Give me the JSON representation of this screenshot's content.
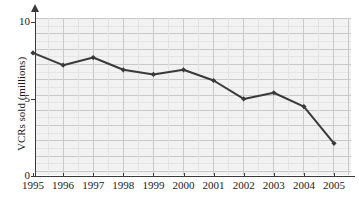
{
  "chart_data": {
    "type": "line",
    "title": "",
    "xlabel": "",
    "ylabel": "VCRs sold (millions)",
    "categories": [
      "1995",
      "1996",
      "1997",
      "1998",
      "1999",
      "2000",
      "2001",
      "2002",
      "2003",
      "2004",
      "2005"
    ],
    "values": [
      8.0,
      7.2,
      7.7,
      6.9,
      6.6,
      6.9,
      6.2,
      5.0,
      5.4,
      4.5,
      2.1
    ],
    "x_tick_labels": [
      "1995",
      "1996",
      "1997",
      "1998",
      "1999",
      "2000",
      "2001",
      "2002",
      "2003",
      "2004",
      "2005"
    ],
    "y_tick_labels": [
      "0",
      "5",
      "10"
    ],
    "y_tick_values": [
      0,
      5,
      10
    ],
    "ylim": [
      0,
      11
    ],
    "xlim": [
      "1995",
      "2005"
    ],
    "grid": true,
    "grid_major_color": "#c9c9c9",
    "grid_minor_color": "#e3e3e3",
    "plot_background": "#f2f2f2",
    "line_color": "#3a3a3a",
    "marker": "diamond",
    "legend": null,
    "legend_position": "none",
    "series": [
      {
        "name": "VCRs sold (millions)",
        "points": [
          {
            "x": "1995",
            "y": 8.0
          },
          {
            "x": "1996",
            "y": 7.2
          },
          {
            "x": "1997",
            "y": 7.7
          },
          {
            "x": "1998",
            "y": 6.9
          },
          {
            "x": "1999",
            "y": 6.6
          },
          {
            "x": "2000",
            "y": 6.9
          },
          {
            "x": "2001",
            "y": 6.2
          },
          {
            "x": "2002",
            "y": 5.0
          },
          {
            "x": "2003",
            "y": 5.4
          },
          {
            "x": "2004",
            "y": 4.5
          },
          {
            "x": "2005",
            "y": 2.1
          }
        ]
      }
    ]
  }
}
